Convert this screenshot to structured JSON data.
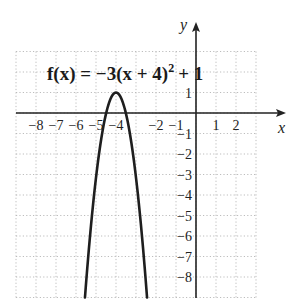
{
  "chart_data": {
    "type": "line",
    "function": "f(x) = -3(x+4)^2 + 1",
    "vertex": [
      -4,
      1
    ],
    "xlabel": "x",
    "ylabel": "y",
    "xlim": [
      -9,
      3
    ],
    "ylim": [
      -9,
      3
    ],
    "grid": true,
    "x_tick_labels": [
      "−8",
      "−7",
      "−6",
      "−5",
      "−4",
      "−2",
      "−1",
      "1",
      "2"
    ],
    "x_tick_values": [
      -8,
      -7,
      -6,
      -5,
      -4,
      -2,
      -1,
      1,
      2
    ],
    "y_tick_labels": [
      "1",
      "−1",
      "−2",
      "−3",
      "−4",
      "−5",
      "−6",
      "−7",
      "−8"
    ],
    "y_tick_values": [
      1,
      -1,
      -2,
      -3,
      -4,
      -5,
      -6,
      -7,
      -8
    ],
    "series": [
      {
        "name": "f(x)",
        "x": [
          -5.8,
          -5.5,
          -5.0,
          -4.5,
          -4.0,
          -3.5,
          -3.0,
          -2.5,
          -2.2
        ],
        "values": [
          -8.72,
          -5.75,
          -2.0,
          0.25,
          1.0,
          0.25,
          -2.0,
          -5.75,
          -8.72
        ]
      }
    ]
  },
  "labels": {
    "title_fx": "f(x) = −3(x + 4)",
    "title_exp": "2",
    "title_tail": "+ 1",
    "x_axis": "x",
    "y_axis": "y"
  }
}
